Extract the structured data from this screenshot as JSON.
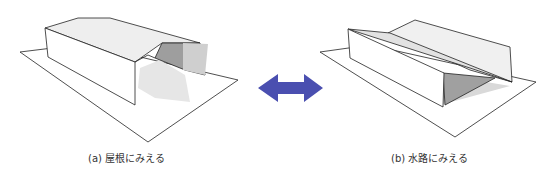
{
  "figure": {
    "panels": [
      {
        "id": "a",
        "caption": "(a) 屋根にみえる",
        "interpretation": "roof"
      },
      {
        "id": "b",
        "caption": "(b) 水路にみえる",
        "interpretation": "water channel"
      }
    ],
    "arrow": {
      "icon": "double-headed-arrow-icon",
      "color": "#4a4fb0"
    },
    "colors": {
      "stroke": "#222222",
      "face_light": "#f2f2f2",
      "face_mid": "#d9d9d9",
      "face_dark": "#a8a8a8",
      "shadow": "#bdbdbd",
      "ground": "#ffffff"
    }
  }
}
